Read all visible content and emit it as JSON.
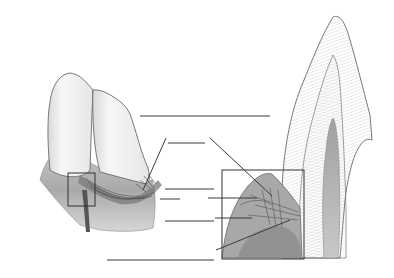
{
  "figure": {
    "panels": [
      {
        "id": "left",
        "description": "Two incisor teeth with gingiva and circular/dentogingival fibers, inset box at interproximal region"
      },
      {
        "id": "right",
        "description": "Sagittal section of tooth crown with gingival tissue, inset box enlarging gingival fiber groups"
      }
    ],
    "label_lines": [
      {
        "id": "L1",
        "x1": 140,
        "y1": 116,
        "x2": 270,
        "y2": 116,
        "text": ""
      },
      {
        "id": "L2",
        "x1": 168,
        "y1": 143,
        "x2": 205,
        "y2": 143,
        "text": ""
      },
      {
        "id": "L3",
        "x1": 165,
        "y1": 189,
        "x2": 214,
        "y2": 189,
        "text": ""
      },
      {
        "id": "L4",
        "x1": 165,
        "y1": 221,
        "x2": 214,
        "y2": 221,
        "text": ""
      },
      {
        "id": "L5",
        "x1": 107,
        "y1": 260,
        "x2": 214,
        "y2": 260,
        "text": ""
      },
      {
        "id": "L6",
        "x1": 208,
        "y1": 198,
        "x2": 257,
        "y2": 198,
        "text": ""
      },
      {
        "id": "L7",
        "x1": 215,
        "y1": 218,
        "x2": 252,
        "y2": 218,
        "text": ""
      }
    ],
    "colors": {
      "line": "#3a3a3a",
      "tissue_dark": "#8a8a8a",
      "tissue_mid": "#b5b5b5",
      "tissue_light": "#dcdcdc",
      "enamel": "#f4f4f4",
      "pulp": "#9a9a9a"
    }
  }
}
